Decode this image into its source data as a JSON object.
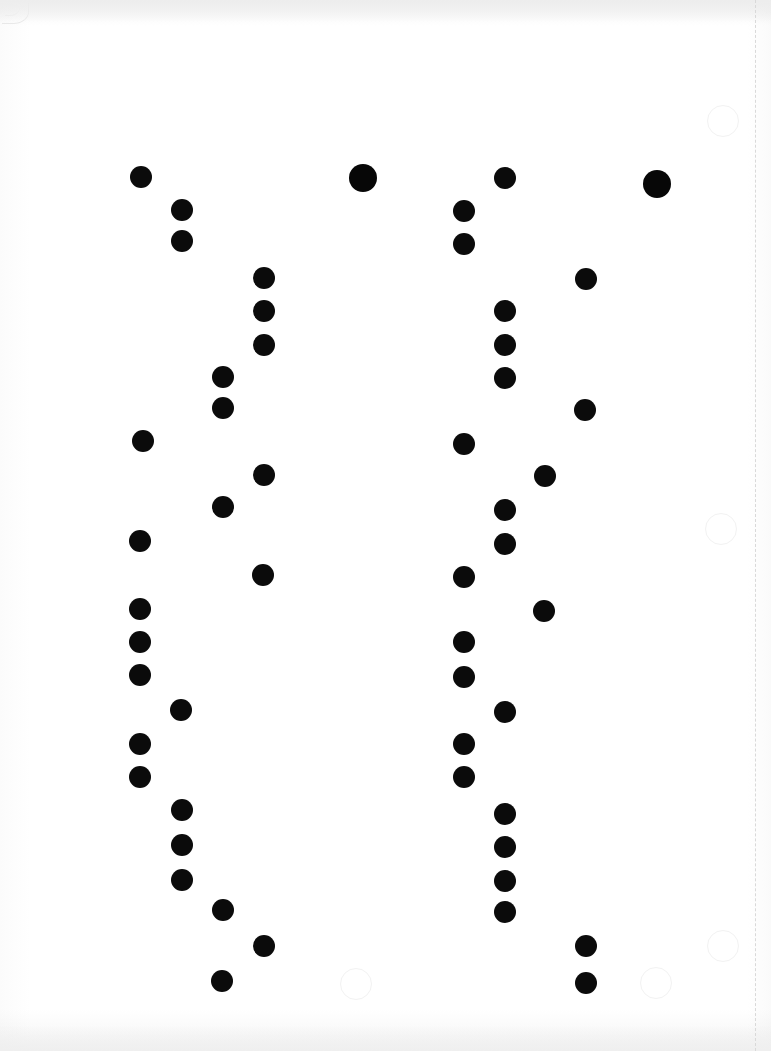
{
  "document": {
    "kind": "scanned-mark-sheet",
    "title": "Scanned dot mark sheet",
    "width": 771,
    "height": 1051,
    "background_color": "#ffffff",
    "mark_color": "#0b0b0b",
    "ghost_color": "#f2f2f2",
    "perforation_color": "#d9d9d9"
  },
  "guides": {
    "perforation_line": {
      "x": 755,
      "style": "dashed",
      "orientation": "vertical"
    },
    "corner_curl": {
      "x": 2,
      "y": 3,
      "label": "page-corner-curl"
    }
  },
  "chart_data": {
    "type": "scatter",
    "xlabel": "",
    "ylabel": "",
    "xlim": [
      0,
      771
    ],
    "ylim": [
      0,
      1051
    ],
    "grid": false,
    "legend": null,
    "series": [
      {
        "name": "left-group-marks",
        "color": "#0b0b0b",
        "points": [
          {
            "x": 141,
            "y": 177,
            "r": 11
          },
          {
            "x": 182,
            "y": 210,
            "r": 11
          },
          {
            "x": 182,
            "y": 241,
            "r": 11
          },
          {
            "x": 264,
            "y": 278,
            "r": 11
          },
          {
            "x": 264,
            "y": 311,
            "r": 11
          },
          {
            "x": 264,
            "y": 345,
            "r": 11
          },
          {
            "x": 223,
            "y": 377,
            "r": 11
          },
          {
            "x": 223,
            "y": 408,
            "r": 11
          },
          {
            "x": 143,
            "y": 441,
            "r": 11
          },
          {
            "x": 264,
            "y": 475,
            "r": 11
          },
          {
            "x": 223,
            "y": 507,
            "r": 11
          },
          {
            "x": 140,
            "y": 541,
            "r": 11
          },
          {
            "x": 263,
            "y": 575,
            "r": 11
          },
          {
            "x": 140,
            "y": 609,
            "r": 11
          },
          {
            "x": 140,
            "y": 642,
            "r": 11
          },
          {
            "x": 140,
            "y": 675,
            "r": 11
          },
          {
            "x": 181,
            "y": 710,
            "r": 11
          },
          {
            "x": 140,
            "y": 744,
            "r": 11
          },
          {
            "x": 140,
            "y": 777,
            "r": 11
          },
          {
            "x": 182,
            "y": 810,
            "r": 11
          },
          {
            "x": 182,
            "y": 845,
            "r": 11
          },
          {
            "x": 182,
            "y": 880,
            "r": 11
          },
          {
            "x": 223,
            "y": 910,
            "r": 11
          },
          {
            "x": 264,
            "y": 946,
            "r": 11
          },
          {
            "x": 222,
            "y": 981,
            "r": 11
          }
        ]
      },
      {
        "name": "left-group-large-mark",
        "color": "#070707",
        "points": [
          {
            "x": 363,
            "y": 178,
            "r": 14
          }
        ]
      },
      {
        "name": "right-group-marks",
        "color": "#0b0b0b",
        "points": [
          {
            "x": 505,
            "y": 178,
            "r": 11
          },
          {
            "x": 464,
            "y": 211,
            "r": 11
          },
          {
            "x": 464,
            "y": 244,
            "r": 11
          },
          {
            "x": 586,
            "y": 279,
            "r": 11
          },
          {
            "x": 505,
            "y": 311,
            "r": 11
          },
          {
            "x": 505,
            "y": 345,
            "r": 11
          },
          {
            "x": 505,
            "y": 378,
            "r": 11
          },
          {
            "x": 585,
            "y": 410,
            "r": 11
          },
          {
            "x": 464,
            "y": 444,
            "r": 11
          },
          {
            "x": 545,
            "y": 476,
            "r": 11
          },
          {
            "x": 505,
            "y": 510,
            "r": 11
          },
          {
            "x": 505,
            "y": 544,
            "r": 11
          },
          {
            "x": 464,
            "y": 577,
            "r": 11
          },
          {
            "x": 544,
            "y": 611,
            "r": 11
          },
          {
            "x": 464,
            "y": 642,
            "r": 11
          },
          {
            "x": 464,
            "y": 677,
            "r": 11
          },
          {
            "x": 505,
            "y": 712,
            "r": 11
          },
          {
            "x": 464,
            "y": 744,
            "r": 11
          },
          {
            "x": 464,
            "y": 777,
            "r": 11
          },
          {
            "x": 505,
            "y": 814,
            "r": 11
          },
          {
            "x": 505,
            "y": 847,
            "r": 11
          },
          {
            "x": 505,
            "y": 881,
            "r": 11
          },
          {
            "x": 505,
            "y": 912,
            "r": 11
          },
          {
            "x": 586,
            "y": 946,
            "r": 11
          },
          {
            "x": 586,
            "y": 983,
            "r": 11
          }
        ]
      },
      {
        "name": "right-group-large-mark",
        "color": "#070707",
        "points": [
          {
            "x": 657,
            "y": 184,
            "r": 14
          }
        ]
      },
      {
        "name": "ghost-unfilled-circles",
        "color": "#f2f2f2",
        "points": [
          {
            "x": 722,
            "y": 120,
            "r": 15
          },
          {
            "x": 720,
            "y": 528,
            "r": 15
          },
          {
            "x": 355,
            "y": 983,
            "r": 15
          },
          {
            "x": 655,
            "y": 982,
            "r": 15
          },
          {
            "x": 722,
            "y": 945,
            "r": 15
          }
        ]
      }
    ]
  }
}
